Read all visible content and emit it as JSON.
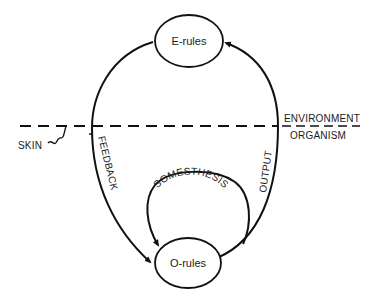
{
  "diagram": {
    "nodes": {
      "e_rules": "E-rules",
      "o_rules": "O-rules"
    },
    "boundary": {
      "upper_label": "ENVIRONMENT",
      "lower_label": "ORGANISM",
      "skin_label": "SKIN"
    },
    "edges": {
      "feedback": "FEEDBACK",
      "output": "OUTPUT",
      "somesthesis": "SOMESTHESIS"
    },
    "colors": {
      "ink": "#111111",
      "background": "#ffffff"
    }
  }
}
